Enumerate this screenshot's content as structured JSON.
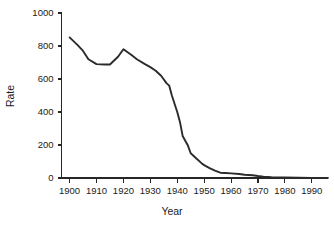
{
  "chart_data": {
    "type": "line",
    "title": "",
    "xlabel": "Year",
    "ylabel": "Rate",
    "xlim": [
      1897,
      1996
    ],
    "ylim": [
      0,
      1000
    ],
    "grid": false,
    "legend": null,
    "xticks": [
      1900,
      1910,
      1920,
      1930,
      1940,
      1950,
      1960,
      1970,
      1980,
      1990
    ],
    "xtick_labels": [
      "1900",
      "1910",
      "1920",
      "1930",
      "1940",
      "1950",
      "1960",
      "1970",
      "1980",
      "1990"
    ],
    "yticks": [
      0,
      200,
      400,
      600,
      800,
      1000
    ],
    "ytick_labels": [
      "0",
      "200",
      "400",
      "600",
      "800",
      "1000"
    ],
    "line_color": "#2b2b2b",
    "series": [
      {
        "name": "Rate",
        "x": [
          1900,
          1903,
          1905,
          1907,
          1910,
          1913,
          1915,
          1918,
          1920,
          1923,
          1925,
          1928,
          1930,
          1932,
          1934,
          1936,
          1937,
          1938,
          1940,
          1941,
          1942,
          1944,
          1945,
          1947,
          1949,
          1950,
          1952,
          1954,
          1956,
          1958,
          1960,
          1963,
          1965,
          1968,
          1970,
          1972,
          1975,
          1978,
          1980,
          1985,
          1990,
          1996
        ],
        "y": [
          852,
          805,
          770,
          720,
          690,
          688,
          688,
          735,
          780,
          745,
          720,
          690,
          672,
          650,
          620,
          575,
          560,
          500,
          400,
          340,
          255,
          195,
          150,
          120,
          90,
          78,
          60,
          45,
          32,
          30,
          28,
          24,
          20,
          17,
          12,
          8,
          5,
          4,
          3,
          2,
          1,
          1
        ]
      }
    ]
  },
  "axis": {
    "y_title": "Rate",
    "x_title": "Year"
  }
}
